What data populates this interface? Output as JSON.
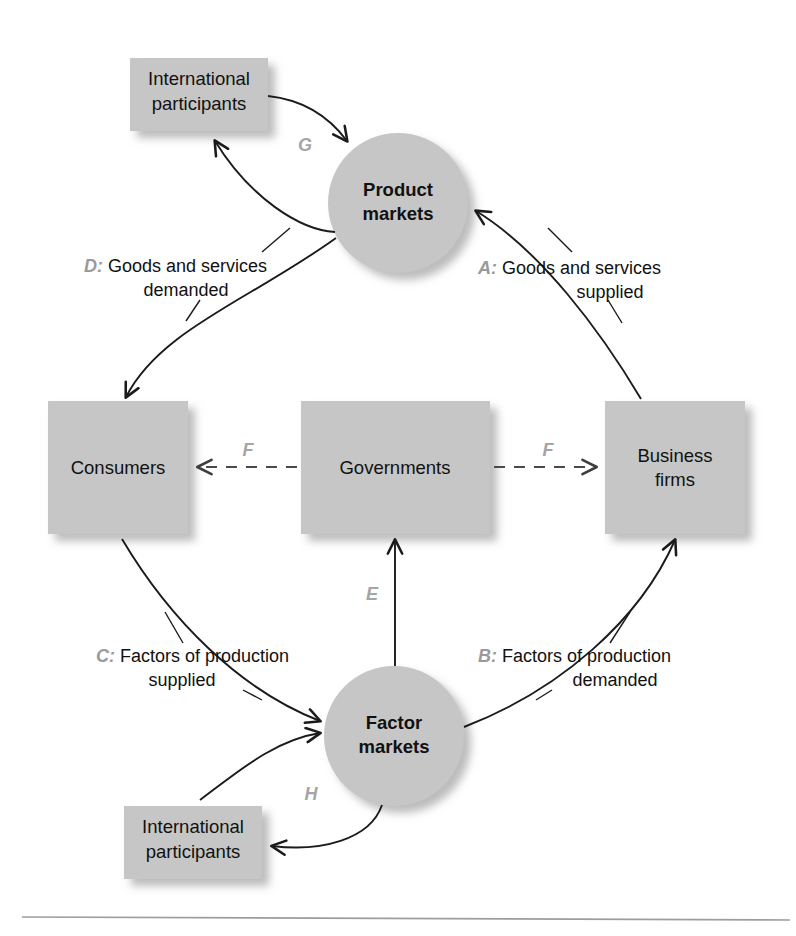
{
  "figure": {
    "type": "circular-flow-diagram",
    "colors": {
      "shape_fill": "#c6c6c6",
      "shape_shadow": "#bdbdbd",
      "connector": "#1b1b1b",
      "key_letter": "#9a9a9a",
      "label_text": "#111111",
      "rule": "#9d9d9d",
      "background": "#ffffff"
    }
  },
  "nodes": {
    "international_top": {
      "label_line1": "International",
      "label_line2": "participants",
      "shape": "rectangle"
    },
    "product_markets": {
      "label_line1": "Product",
      "label_line2": "markets",
      "shape": "circle"
    },
    "consumers": {
      "label_line1": "Consumers",
      "label_line2": "",
      "shape": "square"
    },
    "governments": {
      "label_line1": "Governments",
      "label_line2": "",
      "shape": "rectangle"
    },
    "business_firms": {
      "label_line1": "Business",
      "label_line2": "firms",
      "shape": "square"
    },
    "factor_markets": {
      "label_line1": "Factor",
      "label_line2": "markets",
      "shape": "circle"
    },
    "international_bottom": {
      "label_line1": "International",
      "label_line2": "participants",
      "shape": "rectangle"
    }
  },
  "flows": {
    "a": {
      "key": "A:",
      "text_line1": " Goods and services",
      "text_line2": "supplied",
      "from": "business-firms",
      "to": "product-markets"
    },
    "b": {
      "key": "B:",
      "text_line1": " Factors of production",
      "text_line2": "demanded",
      "from": "factor-markets",
      "to": "business-firms"
    },
    "c": {
      "key": "C:",
      "text_line1": " Factors of production",
      "text_line2": "supplied",
      "from": "consumers",
      "to": "factor-markets"
    },
    "d": {
      "key": "D:",
      "text_line1": " Goods and services",
      "text_line2": "demanded",
      "from": "product-markets",
      "to": "consumers"
    },
    "e": {
      "key": "E",
      "from": "factor-markets",
      "to": "governments"
    },
    "f_left": {
      "key": "F",
      "from": "governments",
      "to": "consumers"
    },
    "f_right": {
      "key": "F",
      "from": "governments",
      "to": "business-firms"
    },
    "g": {
      "key": "G",
      "from": "international-participants-top",
      "to": "product-markets"
    },
    "h": {
      "key": "H",
      "from": "factor-markets",
      "to": "international-participants-bottom"
    }
  }
}
